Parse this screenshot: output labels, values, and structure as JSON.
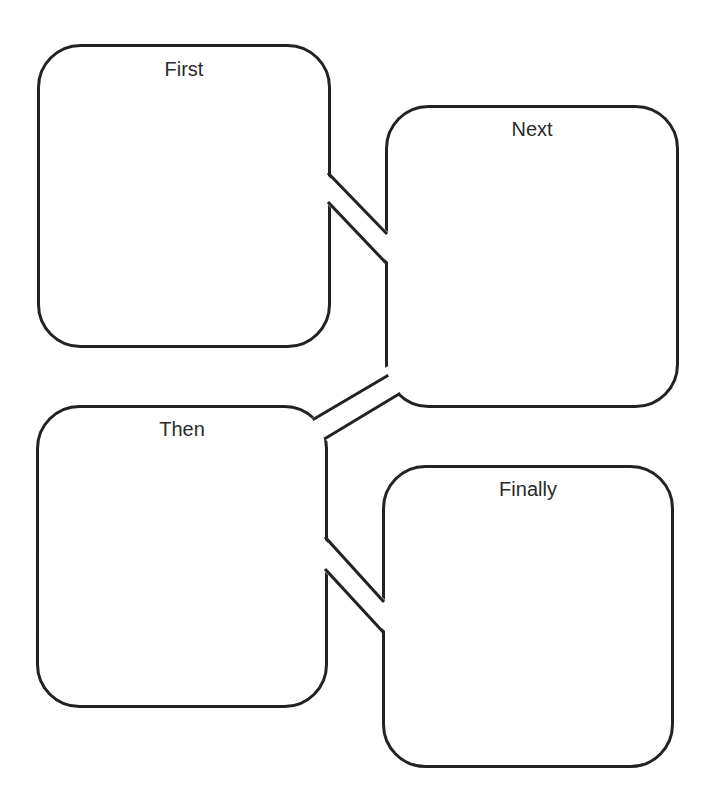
{
  "diagram": {
    "type": "sequence-graphic-organizer",
    "stroke_color": "#222222",
    "background_color": "#ffffff",
    "boxes": [
      {
        "id": "first",
        "label": "First",
        "order": 1
      },
      {
        "id": "next",
        "label": "Next",
        "order": 2
      },
      {
        "id": "then",
        "label": "Then",
        "order": 3
      },
      {
        "id": "finally",
        "label": "Finally",
        "order": 4
      }
    ],
    "connectors": [
      {
        "from": "First",
        "to": "Next"
      },
      {
        "from": "Next",
        "to": "Then"
      },
      {
        "from": "Then",
        "to": "Finally"
      }
    ]
  }
}
